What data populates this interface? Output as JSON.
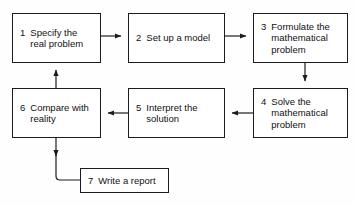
{
  "diagram": {
    "type": "flowchart",
    "background_color": "#fefefe",
    "line_color": "#1c1c1c",
    "text_color": "#111111",
    "nodes": [
      {
        "id": "1",
        "number": "1",
        "label": "Specify the\nreal problem",
        "name": "specify-the-real-problem"
      },
      {
        "id": "2",
        "number": "2",
        "label": "Set up a model",
        "name": "set-up-a-model"
      },
      {
        "id": "3",
        "number": "3",
        "label": "Formulate the\nmathematical\nproblem",
        "name": "formulate-the-mathematical-problem"
      },
      {
        "id": "4",
        "number": "4",
        "label": "Solve the\nmathematical\nproblem",
        "name": "solve-the-mathematical-problem"
      },
      {
        "id": "5",
        "number": "5",
        "label": "Interpret the\nsolution",
        "name": "interpret-the-solution"
      },
      {
        "id": "6",
        "number": "6",
        "label": "Compare with\nreality",
        "name": "compare-with-reality"
      },
      {
        "id": "7",
        "number": "7",
        "label": "Write a report",
        "name": "write-a-report"
      }
    ],
    "edges": [
      {
        "from": "1",
        "to": "2",
        "direction": "right"
      },
      {
        "from": "2",
        "to": "3",
        "direction": "right"
      },
      {
        "from": "3",
        "to": "4",
        "direction": "down"
      },
      {
        "from": "4",
        "to": "5",
        "direction": "left"
      },
      {
        "from": "5",
        "to": "6",
        "direction": "left"
      },
      {
        "from": "6",
        "to": "1",
        "direction": "up"
      },
      {
        "from": "6",
        "to": "7",
        "direction": "down-then-right"
      }
    ]
  }
}
